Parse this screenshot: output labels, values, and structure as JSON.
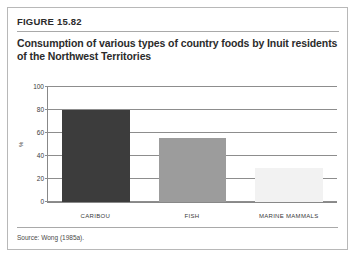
{
  "figure": {
    "label": "FIGURE 15.82",
    "title": "Consumption of various types of country foods by Inuit residents of the Northwest Territories",
    "source": "Source: Wong (1985a)."
  },
  "chart_data": {
    "type": "bar",
    "title": "Consumption of various types of country foods by Inuit residents of the Northwest Territories",
    "categories": [
      "CARIBOU",
      "FISH",
      "MARINE MAMMALS"
    ],
    "values": [
      80,
      56,
      30
    ],
    "xlabel": "",
    "ylabel": "%",
    "ylim": [
      0,
      100
    ],
    "yticks": [
      0,
      20,
      40,
      60,
      80,
      100
    ],
    "grid": true,
    "legend": "none",
    "bar_colors": [
      "#3c3c3c",
      "#9c9c9c",
      "#f2f2f2"
    ]
  }
}
